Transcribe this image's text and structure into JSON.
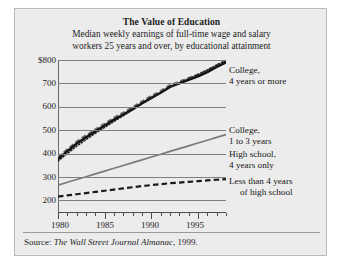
{
  "figure": {
    "title": "The Value of Education",
    "subtitle_line1": "Median weekly earnings of full-time wage and salary",
    "subtitle_line2": "workers 25 years and over, by educational attainment",
    "source_prefix": "Source: ",
    "source_italic": "The Wall Street Journal Almanac",
    "source_suffix": ", 1999.",
    "background_color": "#ececed",
    "frame_color": "#b9b9ba"
  },
  "axis": {
    "y_ticks": [
      "$800",
      "700",
      "600",
      "500",
      "400",
      "300",
      "200"
    ],
    "y_values": [
      800,
      700,
      600,
      500,
      400,
      300,
      200
    ],
    "x_ticks": [
      "1980",
      "1985",
      "1990",
      "1995"
    ],
    "x_tick_values": [
      1980,
      1985,
      1990,
      1995
    ]
  },
  "legend": {
    "college4": {
      "line1": "College,",
      "line2": "4 years or more"
    },
    "college13": {
      "line1": "College,",
      "line2": "1 to 3 years"
    },
    "highschool4": {
      "line1": "High school,",
      "line2": "4 years only"
    },
    "lessthanhs": {
      "line1": "Less than 4 years",
      "line2": "of high school"
    }
  },
  "chart_data": {
    "type": "line",
    "title": "The Value of Education",
    "subtitle": "Median weekly earnings of full-time wage and salary workers 25 years and over, by educational attainment",
    "xlabel": "",
    "ylabel": "Median weekly earnings (dollars)",
    "xlim": [
      1980,
      1998
    ],
    "ylim": [
      150,
      800
    ],
    "grid": "horizontal",
    "legend_position": "right-inline",
    "x": [
      1980,
      1981,
      1982,
      1983,
      1984,
      1985,
      1986,
      1987,
      1988,
      1989,
      1990,
      1991,
      1992,
      1993,
      1994,
      1995,
      1996,
      1997,
      1998
    ],
    "series": [
      {
        "name": "College, 4 years or more",
        "style": "solid-thick-black",
        "color": "#121212",
        "values": [
          376,
          410,
          443,
          470,
          495,
          520,
          545,
          567,
          590,
          615,
          638,
          660,
          685,
          700,
          715,
          730,
          748,
          770,
          790
        ]
      },
      {
        "name": "College, 1 to 3 years",
        "style": "dashed-gray",
        "color": "#6e6e70",
        "values": [
          368,
          400,
          432,
          460,
          487,
          512,
          538,
          562,
          588,
          612,
          636,
          660,
          684,
          702,
          720,
          738,
          757,
          778,
          798
        ]
      },
      {
        "name": "College, 1 to 3 years (dotted)",
        "style": "dotted-black",
        "color": "#1f1f1f",
        "values": [
          320,
          330,
          340,
          350,
          360,
          372,
          383,
          394,
          405,
          416,
          427,
          438,
          449,
          458,
          466,
          474,
          482,
          490,
          498
        ]
      },
      {
        "name": "High school, 4 years only",
        "style": "solid-gray",
        "color": "#7a7a7c",
        "values": [
          265,
          277,
          289,
          301,
          313,
          325,
          337,
          349,
          361,
          373,
          385,
          397,
          409,
          421,
          433,
          445,
          457,
          469,
          481
        ]
      },
      {
        "name": "Less than 4 years of high school",
        "style": "dashed-thick-black",
        "color": "#1a1a1a",
        "values": [
          216,
          221,
          226,
          231,
          236,
          241,
          246,
          251,
          256,
          261,
          265,
          269,
          273,
          276,
          279,
          282,
          285,
          288,
          291
        ]
      }
    ]
  }
}
